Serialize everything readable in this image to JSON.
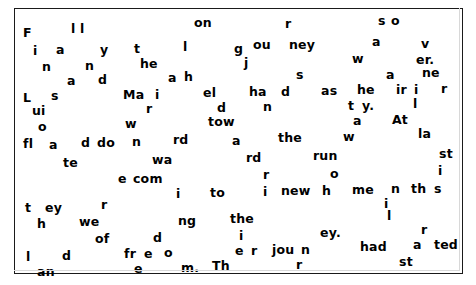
{
  "page": {
    "kind": "scattered-text-puzzle",
    "background_color": "#ffffff",
    "text_color": "#000000",
    "border_color": "#1a1a1a",
    "hidden_message": "Finally on a rainy Monday morning they all set off on their long journey so they had as he had to the new home and the freedom they had always wanted. At last it was over."
  },
  "fragments": [
    {
      "text": "F",
      "x": 22,
      "y": 26
    },
    {
      "text": "l l",
      "x": 70,
      "y": 22
    },
    {
      "text": "on",
      "x": 193,
      "y": 16
    },
    {
      "text": "r",
      "x": 284,
      "y": 17
    },
    {
      "text": "s",
      "x": 377,
      "y": 14
    },
    {
      "text": "o",
      "x": 390,
      "y": 14
    },
    {
      "text": "i",
      "x": 32,
      "y": 44
    },
    {
      "text": "a",
      "x": 55,
      "y": 43
    },
    {
      "text": "y",
      "x": 99,
      "y": 43
    },
    {
      "text": "t",
      "x": 133,
      "y": 42
    },
    {
      "text": "l",
      "x": 182,
      "y": 40
    },
    {
      "text": "g",
      "x": 233,
      "y": 42
    },
    {
      "text": "ou",
      "x": 252,
      "y": 38
    },
    {
      "text": "ney",
      "x": 288,
      "y": 38
    },
    {
      "text": "a",
      "x": 371,
      "y": 35
    },
    {
      "text": "v",
      "x": 420,
      "y": 37
    },
    {
      "text": "n",
      "x": 41,
      "y": 60
    },
    {
      "text": "n",
      "x": 84,
      "y": 59
    },
    {
      "text": "he",
      "x": 139,
      "y": 57
    },
    {
      "text": "j",
      "x": 243,
      "y": 56
    },
    {
      "text": "w",
      "x": 351,
      "y": 52
    },
    {
      "text": "er.",
      "x": 415,
      "y": 53
    },
    {
      "text": "a",
      "x": 66,
      "y": 74
    },
    {
      "text": "d",
      "x": 97,
      "y": 73
    },
    {
      "text": "a",
      "x": 167,
      "y": 71
    },
    {
      "text": "h",
      "x": 183,
      "y": 70
    },
    {
      "text": "s",
      "x": 295,
      "y": 68
    },
    {
      "text": "a",
      "x": 385,
      "y": 68
    },
    {
      "text": "ne",
      "x": 421,
      "y": 66
    },
    {
      "text": "L",
      "x": 22,
      "y": 91
    },
    {
      "text": "s",
      "x": 50,
      "y": 89
    },
    {
      "text": "Ma",
      "x": 122,
      "y": 88
    },
    {
      "text": "i",
      "x": 154,
      "y": 88
    },
    {
      "text": "el",
      "x": 202,
      "y": 86
    },
    {
      "text": "ha",
      "x": 248,
      "y": 85
    },
    {
      "text": "d",
      "x": 280,
      "y": 85
    },
    {
      "text": "as",
      "x": 320,
      "y": 84
    },
    {
      "text": "he",
      "x": 356,
      "y": 83
    },
    {
      "text": "ir",
      "x": 395,
      "y": 83
    },
    {
      "text": "i",
      "x": 413,
      "y": 83
    },
    {
      "text": "r",
      "x": 440,
      "y": 82
    },
    {
      "text": "ui",
      "x": 31,
      "y": 104
    },
    {
      "text": "r",
      "x": 145,
      "y": 102
    },
    {
      "text": "d",
      "x": 216,
      "y": 101
    },
    {
      "text": "n",
      "x": 262,
      "y": 100
    },
    {
      "text": "t",
      "x": 347,
      "y": 99
    },
    {
      "text": "y.",
      "x": 361,
      "y": 99
    },
    {
      "text": "l",
      "x": 412,
      "y": 97
    },
    {
      "text": "o",
      "x": 37,
      "y": 120
    },
    {
      "text": "w",
      "x": 124,
      "y": 117
    },
    {
      "text": "tow",
      "x": 207,
      "y": 115
    },
    {
      "text": "a",
      "x": 352,
      "y": 114
    },
    {
      "text": "At",
      "x": 391,
      "y": 113
    },
    {
      "text": "fl",
      "x": 22,
      "y": 137
    },
    {
      "text": "a",
      "x": 48,
      "y": 138
    },
    {
      "text": "d",
      "x": 80,
      "y": 136
    },
    {
      "text": "do",
      "x": 96,
      "y": 136
    },
    {
      "text": "n",
      "x": 131,
      "y": 135
    },
    {
      "text": "rd",
      "x": 172,
      "y": 133
    },
    {
      "text": "a",
      "x": 231,
      "y": 134
    },
    {
      "text": "the",
      "x": 277,
      "y": 131
    },
    {
      "text": "w",
      "x": 342,
      "y": 130
    },
    {
      "text": "la",
      "x": 417,
      "y": 127
    },
    {
      "text": "te",
      "x": 62,
      "y": 156
    },
    {
      "text": "wa",
      "x": 151,
      "y": 153
    },
    {
      "text": "rd",
      "x": 245,
      "y": 151
    },
    {
      "text": "run",
      "x": 312,
      "y": 149
    },
    {
      "text": "st",
      "x": 438,
      "y": 147
    },
    {
      "text": "e",
      "x": 117,
      "y": 172
    },
    {
      "text": "com",
      "x": 132,
      "y": 172
    },
    {
      "text": "r",
      "x": 262,
      "y": 168
    },
    {
      "text": "o",
      "x": 329,
      "y": 167
    },
    {
      "text": "i",
      "x": 437,
      "y": 164
    },
    {
      "text": "i",
      "x": 175,
      "y": 187
    },
    {
      "text": "to",
      "x": 209,
      "y": 186
    },
    {
      "text": "i",
      "x": 262,
      "y": 185
    },
    {
      "text": "new",
      "x": 280,
      "y": 184
    },
    {
      "text": "h",
      "x": 321,
      "y": 184
    },
    {
      "text": "me",
      "x": 351,
      "y": 183
    },
    {
      "text": "n",
      "x": 390,
      "y": 182
    },
    {
      "text": "th",
      "x": 410,
      "y": 182
    },
    {
      "text": "s",
      "x": 433,
      "y": 182
    },
    {
      "text": "t",
      "x": 24,
      "y": 201
    },
    {
      "text": "ey",
      "x": 44,
      "y": 201
    },
    {
      "text": "r",
      "x": 100,
      "y": 198
    },
    {
      "text": "i",
      "x": 383,
      "y": 197
    },
    {
      "text": "h",
      "x": 36,
      "y": 217
    },
    {
      "text": "we",
      "x": 78,
      "y": 215
    },
    {
      "text": "ng",
      "x": 177,
      "y": 214
    },
    {
      "text": "the",
      "x": 229,
      "y": 212
    },
    {
      "text": "l",
      "x": 386,
      "y": 209
    },
    {
      "text": "of",
      "x": 94,
      "y": 232
    },
    {
      "text": "d",
      "x": 152,
      "y": 231
    },
    {
      "text": "i",
      "x": 238,
      "y": 229
    },
    {
      "text": "ey.",
      "x": 319,
      "y": 226
    },
    {
      "text": "r",
      "x": 420,
      "y": 223
    },
    {
      "text": "l",
      "x": 25,
      "y": 250
    },
    {
      "text": "d",
      "x": 61,
      "y": 249
    },
    {
      "text": "fr",
      "x": 123,
      "y": 247
    },
    {
      "text": "e",
      "x": 143,
      "y": 247
    },
    {
      "text": "o",
      "x": 163,
      "y": 246
    },
    {
      "text": "e",
      "x": 234,
      "y": 244
    },
    {
      "text": "r",
      "x": 250,
      "y": 244
    },
    {
      "text": "jou",
      "x": 271,
      "y": 243
    },
    {
      "text": "n",
      "x": 300,
      "y": 243
    },
    {
      "text": "had",
      "x": 359,
      "y": 240
    },
    {
      "text": "a",
      "x": 412,
      "y": 238
    },
    {
      "text": "ted",
      "x": 433,
      "y": 238
    },
    {
      "text": "an",
      "x": 36,
      "y": 265
    },
    {
      "text": "e",
      "x": 133,
      "y": 262
    },
    {
      "text": "m.",
      "x": 180,
      "y": 261
    },
    {
      "text": "Th",
      "x": 211,
      "y": 259
    },
    {
      "text": "r",
      "x": 295,
      "y": 258
    },
    {
      "text": "st",
      "x": 398,
      "y": 255
    }
  ]
}
